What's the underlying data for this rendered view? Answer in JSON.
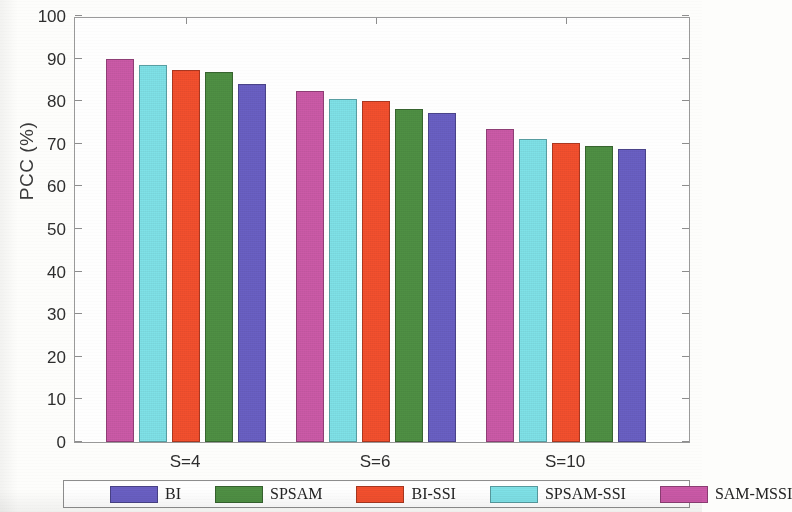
{
  "chart_data": {
    "type": "bar",
    "title": "",
    "xlabel": "",
    "ylabel": "PCC (%)",
    "categories": [
      "S=4",
      "S=6",
      "S=10"
    ],
    "ylim": [
      0,
      100
    ],
    "yticks": [
      0,
      10,
      20,
      30,
      40,
      50,
      60,
      70,
      80,
      90,
      100
    ],
    "grid": false,
    "legend_position": "bottom",
    "bar_draw_order": [
      "SAM-MSSI",
      "SPSAM-SSI",
      "BI-SSI",
      "SPSAM",
      "BI"
    ],
    "series": [
      {
        "name": "BI",
        "color": "#6a60c4",
        "values": [
          84.0,
          77.2,
          68.8
        ]
      },
      {
        "name": "SPSAM",
        "color": "#4f9044",
        "values": [
          86.8,
          78.2,
          69.5
        ]
      },
      {
        "name": "BI-SSI",
        "color": "#f4502e",
        "values": [
          87.4,
          80.0,
          70.3
        ]
      },
      {
        "name": "SPSAM-SSI",
        "color": "#7fe2e8",
        "values": [
          88.4,
          80.6,
          71.2
        ]
      },
      {
        "name": "SAM-MSSI",
        "color": "#cc5aa8",
        "values": [
          90.0,
          82.4,
          73.4
        ]
      }
    ],
    "legend": [
      {
        "label": "BI",
        "color": "#6a60c4"
      },
      {
        "label": "SPSAM",
        "color": "#4f9044"
      },
      {
        "label": "BI-SSI",
        "color": "#f4502e"
      },
      {
        "label": "SPSAM-SSI",
        "color": "#7fe2e8"
      },
      {
        "label": "SAM-MSSI",
        "color": "#cc5aa8"
      }
    ]
  }
}
